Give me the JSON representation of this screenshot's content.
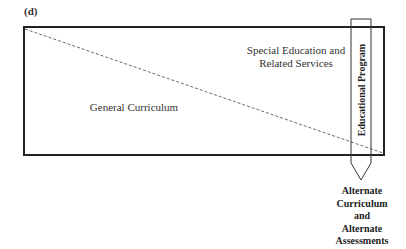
{
  "panel_label": "(d)",
  "regions": {
    "special_line1": "Special Education and",
    "special_line2": "Related Services",
    "general": "General Curriculum"
  },
  "pencil_label": "Educational Program",
  "outcome": {
    "line1": "Alternate",
    "line2": "Curriculum",
    "line3": "and",
    "line4": "Alternate",
    "line5": "Assessments"
  },
  "colors": {
    "stroke": "#222222",
    "background": "#ffffff"
  }
}
